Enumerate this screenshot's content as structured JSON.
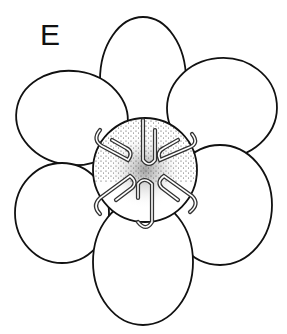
{
  "figure": {
    "panel_label": "E",
    "colors": {
      "stroke": "#111111",
      "fill": "#ffffff",
      "stipple": "#222222"
    },
    "lobes": [
      {
        "name": "top",
        "cx": 143,
        "cy": 80,
        "rx": 43,
        "ry": 63,
        "rot": 0
      },
      {
        "name": "upper-left",
        "cx": 72,
        "cy": 118,
        "rx": 56,
        "ry": 47,
        "rot": 8
      },
      {
        "name": "upper-right",
        "cx": 222,
        "cy": 108,
        "rx": 55,
        "ry": 50,
        "rot": -5
      },
      {
        "name": "lower-left",
        "cx": 62,
        "cy": 213,
        "rx": 47,
        "ry": 50,
        "rot": 0
      },
      {
        "name": "lower-right",
        "cx": 220,
        "cy": 205,
        "rx": 52,
        "ry": 60,
        "rot": 0
      },
      {
        "name": "bottom",
        "cx": 143,
        "cy": 262,
        "rx": 50,
        "ry": 63,
        "rot": 0
      }
    ],
    "disc": {
      "cx": 145,
      "cy": 170,
      "r": 52
    },
    "loops_count": 6
  }
}
